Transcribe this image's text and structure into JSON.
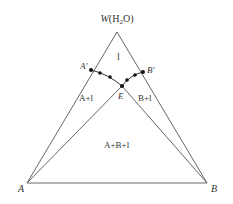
{
  "diagram": {
    "type": "ternary-phase-diagram",
    "vertices": {
      "top": {
        "label_main": "W",
        "label_paren": "(H",
        "label_sub": "2",
        "label_end": "O)",
        "x": 117,
        "y": 32
      },
      "left": {
        "label": "A",
        "x": 27,
        "y": 183
      },
      "right": {
        "label": "B",
        "x": 207,
        "y": 183
      }
    },
    "points": {
      "a_prime": {
        "label": "A′",
        "x": 91,
        "y": 70
      },
      "b_prime": {
        "label": "B′",
        "x": 143,
        "y": 72
      },
      "eutectic": {
        "label": "E",
        "x": 122,
        "y": 86
      }
    },
    "curve_dots": [
      {
        "x": 100,
        "y": 73
      },
      {
        "x": 110,
        "y": 77
      },
      {
        "x": 127,
        "y": 80
      },
      {
        "x": 135,
        "y": 75
      }
    ],
    "regions": {
      "liquid": "l",
      "a_liquid": "A+l",
      "b_liquid": "B+l",
      "ab_liquid": "A+B+l"
    },
    "colors": {
      "line": "#555555",
      "dot": "#111111",
      "text": "#333333"
    }
  }
}
